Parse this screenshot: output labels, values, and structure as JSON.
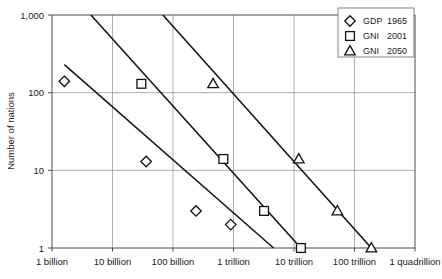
{
  "chart_data": {
    "type": "scatter",
    "title": "",
    "xlabel": "",
    "ylabel": "Number of nations",
    "xscale": "log",
    "yscale": "log",
    "grid": true,
    "legend_position": "top-right",
    "x_tick_labels": [
      "1 billion",
      "10 billion",
      "100 billion",
      "1 trillion",
      "10 trillion",
      "100 trillion",
      "1 quadrillion"
    ],
    "x_tick_values": [
      1000000000.0,
      10000000000.0,
      100000000000.0,
      1000000000000.0,
      10000000000000.0,
      100000000000000.0,
      1000000000000000.0
    ],
    "y_tick_labels": [
      "1,000",
      "100",
      "10",
      "1"
    ],
    "y_tick_values": [
      1000,
      100,
      10,
      1
    ],
    "xlim": [
      1000000000.0,
      1000000000000000.0
    ],
    "ylim": [
      1,
      1000
    ],
    "series": [
      {
        "name": "GDP 1965",
        "marker": "diamond",
        "points": [
          {
            "x": 1600000000.0,
            "y": 140
          },
          {
            "x": 36000000000.0,
            "y": 13
          },
          {
            "x": 240000000000.0,
            "y": 3
          },
          {
            "x": 900000000000.0,
            "y": 2
          }
        ],
        "trend_line": {
          "x_start": 1600000000.0,
          "y_start": 230,
          "x_end": 4600000000000.0,
          "y_end": 1
        }
      },
      {
        "name": "GNI 2001",
        "marker": "square",
        "points": [
          {
            "x": 30000000000.0,
            "y": 130
          },
          {
            "x": 680000000000.0,
            "y": 14
          },
          {
            "x": 3200000000000.0,
            "y": 3
          },
          {
            "x": 13000000000000.0,
            "y": 1
          }
        ],
        "trend_line": {
          "x_start": 4400000000.0,
          "y_start": 1000,
          "x_end": 13000000000000.0,
          "y_end": 1
        }
      },
      {
        "name": "GNI 2050",
        "marker": "triangle",
        "points": [
          {
            "x": 460000000000.0,
            "y": 130
          },
          {
            "x": 12000000000000.0,
            "y": 14
          },
          {
            "x": 52000000000000.0,
            "y": 3
          },
          {
            "x": 190000000000000.0,
            "y": 1
          }
        ],
        "trend_line": {
          "x_start": 68000000000.0,
          "y_start": 1000,
          "x_end": 190000000000000.0,
          "y_end": 1
        }
      }
    ]
  },
  "legend": {
    "entries": [
      {
        "marker": "diamond",
        "name": "GDP",
        "year": "1965"
      },
      {
        "marker": "square",
        "name": "GNI",
        "year": "2001"
      },
      {
        "marker": "triangle",
        "name": "GNI",
        "year": "2050"
      }
    ]
  },
  "axes": {
    "y_title": "Number of nations"
  }
}
